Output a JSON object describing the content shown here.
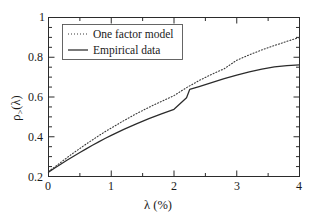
{
  "chart_data": {
    "type": "line",
    "title": "",
    "xlabel": "λ (%)",
    "ylabel": "ρ>(λ)",
    "ylabel_base": "ρ",
    "ylabel_sub": ">",
    "ylabel_arg": "(λ)",
    "xlim": [
      0,
      4
    ],
    "ylim": [
      0.2,
      1
    ],
    "grid": false,
    "legend_position": "upper-left-inside",
    "xticks": [
      0,
      1,
      2,
      3,
      4
    ],
    "xtick_labels": [
      "0",
      "1",
      "2",
      "3",
      "4"
    ],
    "yticks": [
      0.2,
      0.4,
      0.6,
      0.8,
      1
    ],
    "ytick_labels": [
      "0.2",
      "0.4",
      "0.6",
      "0.8",
      "1"
    ],
    "x_minor_step": 0.5,
    "y_minor_step": 0.05,
    "series": [
      {
        "name": "One factor model",
        "style": "dotted",
        "color": "#3a3a3a",
        "x": [
          0,
          0.1,
          0.2,
          0.3,
          0.4,
          0.5,
          0.6,
          0.7,
          0.8,
          0.9,
          1.0,
          1.2,
          1.4,
          1.6,
          1.8,
          2.0,
          2.2,
          2.4,
          2.6,
          2.8,
          3.0,
          3.2,
          3.4,
          3.6,
          3.8,
          4.0
        ],
        "y": [
          0.225,
          0.248,
          0.272,
          0.296,
          0.319,
          0.341,
          0.363,
          0.384,
          0.405,
          0.425,
          0.444,
          0.481,
          0.516,
          0.548,
          0.578,
          0.607,
          0.647,
          0.683,
          0.714,
          0.742,
          0.785,
          0.812,
          0.837,
          0.859,
          0.88,
          0.9
        ]
      },
      {
        "name": "Empirical data",
        "style": "solid",
        "color": "#2b2b2b",
        "x": [
          0,
          0.1,
          0.2,
          0.3,
          0.4,
          0.5,
          0.6,
          0.7,
          0.8,
          0.9,
          1.0,
          1.2,
          1.4,
          1.6,
          1.8,
          2.0,
          2.2,
          2.25,
          2.4,
          2.6,
          2.8,
          3.0,
          3.2,
          3.4,
          3.6,
          3.8,
          4.0
        ],
        "y": [
          0.222,
          0.243,
          0.263,
          0.283,
          0.302,
          0.321,
          0.339,
          0.357,
          0.374,
          0.391,
          0.407,
          0.437,
          0.465,
          0.491,
          0.515,
          0.538,
          0.596,
          0.638,
          0.652,
          0.672,
          0.692,
          0.71,
          0.726,
          0.74,
          0.751,
          0.758,
          0.762
        ]
      }
    ]
  },
  "legend": {
    "items": [
      {
        "label": "One factor model",
        "style": "dotted"
      },
      {
        "label": "Empirical data",
        "style": "solid"
      }
    ]
  },
  "axis": {
    "x_label": "λ (%)",
    "x_tick_0": "0",
    "x_tick_1": "1",
    "x_tick_2": "2",
    "x_tick_3": "3",
    "x_tick_4": "4",
    "y_tick_0": "0.2",
    "y_tick_1": "0.4",
    "y_tick_2": "0.6",
    "y_tick_3": "0.8",
    "y_tick_4": "1"
  },
  "colors": {
    "axis": "#2b2b2b",
    "model_curve": "#3a3a3a",
    "empirical_curve": "#2b2b2b",
    "background": "#ffffff",
    "legend_border": "#555555"
  }
}
